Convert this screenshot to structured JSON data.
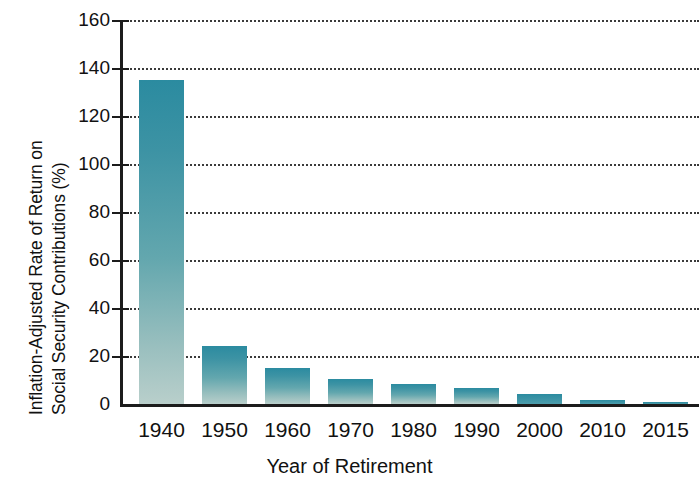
{
  "chart_data": {
    "type": "bar",
    "title": "",
    "xlabel": "Year of Retirement",
    "ylabel": "Inflation-Adjusted Rate of Return on Social Security Contributions (%)",
    "ylabel_line1": "Inflation-Adjusted Rate of Return on",
    "ylabel_line2": "Social Security Contributions (%)",
    "categories": [
      "1940",
      "1950",
      "1960",
      "1970",
      "1980",
      "1990",
      "2000",
      "2010",
      "2015"
    ],
    "values": [
      135,
      24,
      15,
      10.5,
      8.5,
      6.5,
      4,
      1.5,
      0.8
    ],
    "ylim": [
      0,
      160
    ],
    "ytick_labels": [
      "0",
      "20",
      "40",
      "60",
      "80",
      "100",
      "120",
      "140",
      "160"
    ],
    "ytick_values": [
      0,
      20,
      40,
      60,
      80,
      100,
      120,
      140,
      160
    ],
    "grid": "horizontal-dotted",
    "legend": "none",
    "bar_color_top": "#2b8ba0",
    "bar_color_bottom": "#b9cfcb",
    "axis_color": "#1c1c1c",
    "background": "#ffffff"
  }
}
